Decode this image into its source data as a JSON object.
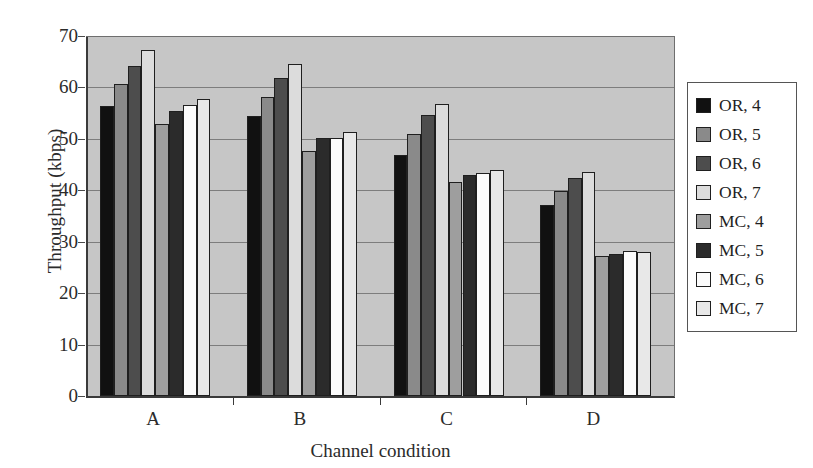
{
  "chart_data": {
    "type": "bar",
    "title": "",
    "xlabel": "Channel condition",
    "ylabel": "Throughput (kbps)",
    "categories": [
      "A",
      "B",
      "C",
      "D"
    ],
    "ylim": [
      0,
      70
    ],
    "ytick_labels": [
      "0",
      "10",
      "20",
      "30",
      "40",
      "50",
      "60",
      "70"
    ],
    "ytick_values": [
      0,
      10,
      20,
      30,
      40,
      50,
      60,
      70
    ],
    "grid": true,
    "legend_position": "right-outside",
    "series": [
      {
        "name": "OR, 4",
        "color": "#111111",
        "values": [
          56.3,
          54.4,
          46.9,
          37.1
        ]
      },
      {
        "name": "OR, 5",
        "color": "#8a8a8a",
        "values": [
          60.6,
          58.2,
          51.0,
          39.9
        ]
      },
      {
        "name": "OR, 6",
        "color": "#4d4d4d",
        "values": [
          64.1,
          61.8,
          54.7,
          42.4
        ]
      },
      {
        "name": "OR, 7",
        "color": "#dcdcdc",
        "values": [
          67.3,
          64.5,
          56.7,
          43.5
        ]
      },
      {
        "name": "MC, 4",
        "color": "#9e9e9e",
        "values": [
          52.9,
          47.6,
          41.7,
          27.2
        ]
      },
      {
        "name": "MC, 5",
        "color": "#2b2b2b",
        "values": [
          55.5,
          50.2,
          43.0,
          27.6
        ]
      },
      {
        "name": "MC, 6",
        "color": "#fbfbfb",
        "values": [
          56.6,
          50.1,
          43.4,
          28.2
        ]
      },
      {
        "name": "MC, 7",
        "color": "#e8e8e8",
        "values": [
          57.7,
          51.3,
          43.9,
          28.1
        ]
      }
    ]
  },
  "legend": {
    "items": [
      {
        "label": "OR, 4"
      },
      {
        "label": "OR, 5"
      },
      {
        "label": "OR, 6"
      },
      {
        "label": "OR, 7"
      },
      {
        "label": "MC, 4"
      },
      {
        "label": "MC, 5"
      },
      {
        "label": "MC, 6"
      },
      {
        "label": "MC, 7"
      }
    ]
  }
}
